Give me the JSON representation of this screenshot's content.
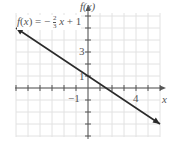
{
  "chart_data": {
    "type": "line",
    "title": "",
    "equation_label": "f(x) = −2/3 x + 1",
    "equation": {
      "prefix": "f(x) = −",
      "num": "2",
      "den": "3",
      "suffix": "x + 1"
    },
    "xlabel": "x",
    "ylabel": "f(x)",
    "xlim": [
      -6,
      6
    ],
    "ylim": [
      -4,
      6
    ],
    "grid": true,
    "tick_spacing": 1,
    "tick_labels": {
      "x": [
        "−1",
        "4"
      ],
      "y": [
        "1",
        "3",
        "−1"
      ]
    },
    "series": [
      {
        "name": "f(x) = −(2/3)x + 1",
        "x": [
          -6,
          6
        ],
        "y": [
          5,
          -3
        ],
        "slope": -0.6667,
        "intercept": 1,
        "arrows": "both"
      }
    ]
  },
  "colors": {
    "line": "#2a2a2a",
    "grid": "#e2e2e2",
    "axis": "#555555",
    "text": "#555555"
  }
}
